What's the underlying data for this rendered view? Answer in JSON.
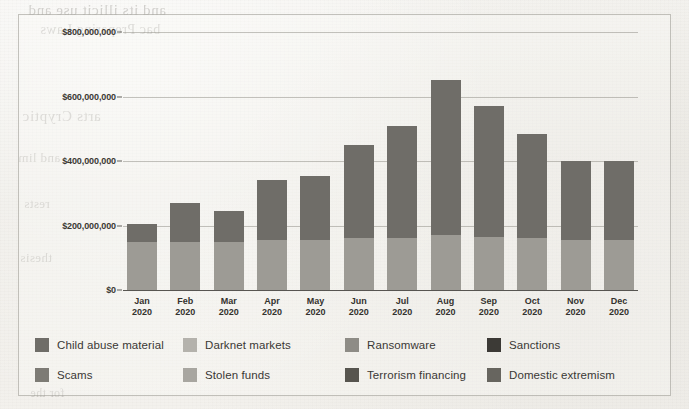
{
  "figure": {
    "background_color": "#f2f1ee",
    "frame_color": "#96938c"
  },
  "bleed_through_text": {
    "line1": "and its illicit use and",
    "line2": "bac Preparing Laws",
    "line3": "arts Cryptic",
    "line4": "and lim",
    "line5": "rests",
    "line6": "thesis",
    "line7": "for the"
  },
  "chart_data": {
    "type": "bar",
    "title": "",
    "subtitle": "",
    "xlabel": "",
    "ylabel": "",
    "grid": true,
    "legend_position": "bottom",
    "ylim": [
      0,
      800000000
    ],
    "yticks": [
      0,
      200000000,
      400000000,
      600000000,
      800000000
    ],
    "ytick_labels": [
      "$0",
      "$200,000,000",
      "$400,000,000",
      "$600,000,000",
      "$800,000,000"
    ],
    "categories": [
      "Jan 2020",
      "Feb 2020",
      "Mar 2020",
      "Apr 2020",
      "May 2020",
      "Jun 2020",
      "Jul 2020",
      "Aug 2020",
      "Sep 2020",
      "Oct 2020",
      "Nov 2020",
      "Dec 2020"
    ],
    "category_lines": [
      [
        "Jan",
        "2020"
      ],
      [
        "Feb",
        "2020"
      ],
      [
        "Mar",
        "2020"
      ],
      [
        "Apr",
        "2020"
      ],
      [
        "May",
        "2020"
      ],
      [
        "Jun",
        "2020"
      ],
      [
        "Jul",
        "2020"
      ],
      [
        "Aug",
        "2020"
      ],
      [
        "Sep",
        "2020"
      ],
      [
        "Oct",
        "2020"
      ],
      [
        "Nov",
        "2020"
      ],
      [
        "Dec",
        "2020"
      ]
    ],
    "values": [
      205000000,
      270000000,
      245000000,
      340000000,
      355000000,
      450000000,
      510000000,
      650000000,
      570000000,
      485000000,
      400000000,
      400000000
    ],
    "lower_segment_values": [
      150000000,
      150000000,
      150000000,
      155000000,
      155000000,
      160000000,
      160000000,
      170000000,
      165000000,
      160000000,
      155000000,
      155000000
    ],
    "series": [
      {
        "name": "lower-stack",
        "color": "#9d9b95",
        "values": [
          150000000,
          150000000,
          150000000,
          155000000,
          155000000,
          160000000,
          160000000,
          170000000,
          165000000,
          160000000,
          155000000,
          155000000
        ]
      },
      {
        "name": "upper-stack",
        "color": "#6f6d68",
        "values": [
          55000000,
          120000000,
          95000000,
          185000000,
          200000000,
          290000000,
          350000000,
          480000000,
          405000000,
          325000000,
          245000000,
          245000000
        ]
      }
    ],
    "legend": [
      {
        "label": "Child abuse material",
        "color": "#6f6d68"
      },
      {
        "label": "Darknet markets",
        "color": "#b4b2ac"
      },
      {
        "label": "Ransomware",
        "color": "#8e8c86"
      },
      {
        "label": "Sanctions",
        "color": "#3c3a36"
      },
      {
        "label": "Scams",
        "color": "#7d7b75"
      },
      {
        "label": "Stolen funds",
        "color": "#a8a6a0"
      },
      {
        "label": "Terrorism financing",
        "color": "#57554f"
      },
      {
        "label": "Domestic extremism",
        "color": "#67655f"
      }
    ]
  }
}
